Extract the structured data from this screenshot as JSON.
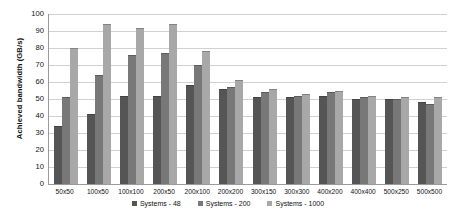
{
  "chart_data": {
    "type": "bar",
    "title": "",
    "xlabel": "",
    "ylabel": "Achieved bandwidth (GB/s)",
    "ylim": [
      0,
      100
    ],
    "ytick_step": 10,
    "yticks": [
      0,
      10,
      20,
      30,
      40,
      50,
      60,
      70,
      80,
      90,
      100
    ],
    "grid": true,
    "legend_position": "bottom",
    "categories": [
      "50x50",
      "100x50",
      "100x100",
      "200x50",
      "200x100",
      "200x200",
      "300x150",
      "300x300",
      "400x200",
      "400x400",
      "500x250",
      "500x500"
    ],
    "series": [
      {
        "name": "Systems - 48",
        "color": "#555555",
        "values": [
          34,
          41,
          52,
          52,
          58,
          56,
          51,
          51,
          52,
          50,
          50,
          48
        ]
      },
      {
        "name": "Systems - 200",
        "color": "#787878",
        "values": [
          51,
          64,
          76,
          77,
          70,
          57,
          54,
          52,
          54,
          51,
          50,
          47
        ]
      },
      {
        "name": "Systems - 1000",
        "color": "#a8a8a8",
        "values": [
          80,
          94,
          92,
          94,
          78,
          61,
          56,
          53,
          55,
          52,
          51,
          51
        ]
      }
    ]
  },
  "legend": {
    "items": [
      {
        "label": "Systems - 48",
        "color": "#555555"
      },
      {
        "label": "Systems - 200",
        "color": "#787878"
      },
      {
        "label": "Systems - 1000",
        "color": "#a8a8a8"
      }
    ]
  }
}
